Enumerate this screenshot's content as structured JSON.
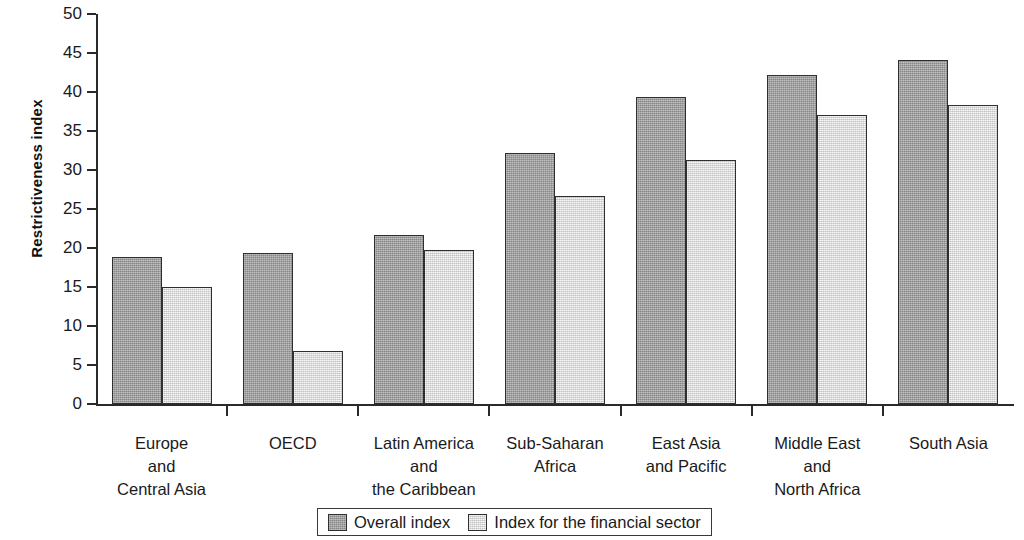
{
  "chart_data": {
    "type": "bar",
    "title": "",
    "xlabel": "",
    "ylabel": "Restrictiveness index",
    "ylim": [
      0,
      50
    ],
    "ytick_step": 5,
    "yticks": [
      0,
      5,
      10,
      15,
      20,
      25,
      30,
      35,
      40,
      45,
      50
    ],
    "ytick_labels": [
      "0",
      "5",
      "10",
      "15",
      "20",
      "25",
      "30",
      "35",
      "40",
      "45",
      "50"
    ],
    "grid": false,
    "legend_position": "bottom-center",
    "categories": [
      "Europe\nand\nCentral Asia",
      "OECD",
      "Latin America\nand\nthe Caribbean",
      "Sub-Saharan\nAfrica",
      "East Asia\nand Pacific",
      "Middle East\nand\nNorth Africa",
      "South Asia"
    ],
    "series": [
      {
        "name": "Overall index",
        "color": "#9d9d9d",
        "values": [
          18.9,
          19.3,
          21.7,
          32.2,
          39.3,
          42.2,
          44.1
        ]
      },
      {
        "name": "Index for the financial sector",
        "color": "#e3e3e3",
        "values": [
          15.0,
          6.8,
          19.7,
          26.7,
          31.3,
          37.0,
          38.3
        ]
      }
    ]
  },
  "legend": {
    "items": [
      {
        "label": "Overall index",
        "swatch": "dark"
      },
      {
        "label": "Index for the financial sector",
        "swatch": "light"
      }
    ]
  }
}
